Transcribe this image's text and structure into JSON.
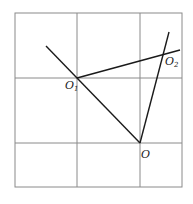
{
  "diagram": {
    "title": "",
    "grid": {
      "x_lines": [
        15,
        77,
        140,
        182
      ],
      "y_lines": [
        13,
        78,
        143,
        187
      ],
      "color": "#888888"
    },
    "points": {
      "O1": {
        "label": "O",
        "sub": "1",
        "x": 77,
        "y": 78
      },
      "O2": {
        "label": "O",
        "sub": "2",
        "x": 163,
        "y": 55
      },
      "O": {
        "label": "O",
        "sub": "",
        "x": 140,
        "y": 143
      }
    },
    "segments": [
      {
        "from": [
          46,
          46
        ],
        "to": [
          140,
          143
        ],
        "name": "line-through-O1-to-O"
      },
      {
        "from": [
          77,
          78
        ],
        "to": [
          180,
          50
        ],
        "name": "line-O1-through-O2"
      },
      {
        "from": [
          140,
          143
        ],
        "to": [
          169,
          32
        ],
        "name": "line-O-through-O2"
      }
    ],
    "line_color": "#1a1a1a"
  }
}
